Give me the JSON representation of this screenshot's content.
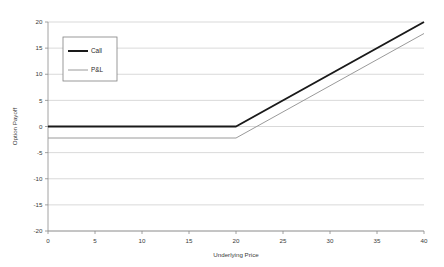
{
  "chart_data": {
    "type": "line",
    "title": "",
    "xlabel": "Underlying Price",
    "ylabel": "Option Payoff",
    "xlim": [
      0,
      40
    ],
    "ylim": [
      -20,
      20
    ],
    "xticks": [
      0,
      5,
      10,
      15,
      20,
      25,
      30,
      35,
      40
    ],
    "yticks": [
      -20,
      -15,
      -10,
      -5,
      0,
      5,
      10,
      15,
      20
    ],
    "xtick_labels": [
      "0",
      "5",
      "10",
      "15",
      "20",
      "25",
      "30",
      "35",
      "40"
    ],
    "ytick_labels": [
      "-20",
      "-15",
      "-10",
      "-5",
      "0",
      "5",
      "10",
      "15",
      "20"
    ],
    "grid": "horizontal",
    "legend_position": "upper-left-inside",
    "strike": 20,
    "premium": 2.2,
    "series": [
      {
        "name": "Call",
        "color": "#1a1a1a",
        "width": 2.0,
        "x": [
          0,
          20,
          40
        ],
        "values": [
          0,
          0,
          20
        ]
      },
      {
        "name": "P&L",
        "color": "#9a9a9a",
        "width": 1.0,
        "x": [
          0,
          20,
          40
        ],
        "values": [
          -2.2,
          -2.2,
          17.8
        ]
      }
    ]
  },
  "legend": {
    "items": [
      {
        "label": "Call"
      },
      {
        "label": "P&L"
      }
    ]
  },
  "colors": {
    "call_line": "#1a1a1a",
    "pnl_line": "#9a9a9a",
    "gridline": "#c9c9c9",
    "axis": "#8a8a8a",
    "text": "#3a3a3a",
    "legend_border": "#808080",
    "background": "#ffffff"
  }
}
